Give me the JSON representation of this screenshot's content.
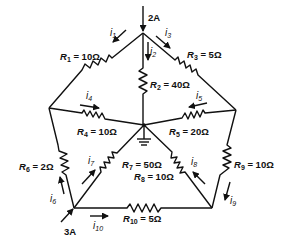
{
  "diagram": {
    "type": "circuit",
    "nodes": {
      "top": {
        "x": 143,
        "y": 33
      },
      "left": {
        "x": 49,
        "y": 108
      },
      "right": {
        "x": 236,
        "y": 110
      },
      "center": {
        "x": 144,
        "y": 125
      },
      "bottom_left": {
        "x": 74,
        "y": 208
      },
      "bottom_right": {
        "x": 212,
        "y": 208
      }
    },
    "sources": [
      {
        "id": "src_top",
        "label": "2A",
        "node": "top",
        "direction": "in"
      },
      {
        "id": "src_bl",
        "label": "3A",
        "node": "bottom_left",
        "direction": "in"
      }
    ],
    "resistors": [
      {
        "id": "R1",
        "name": "R",
        "sub": "1",
        "value": " = 10Ω",
        "from": "top",
        "to": "left"
      },
      {
        "id": "R2",
        "name": "R",
        "sub": "2",
        "value": " = 40Ω",
        "from": "top",
        "to": "center"
      },
      {
        "id": "R3",
        "name": "R",
        "sub": "3",
        "value": " = 5Ω",
        "from": "top",
        "to": "right"
      },
      {
        "id": "R4",
        "name": "R",
        "sub": "4",
        "value": " = 10Ω",
        "from": "left",
        "to": "center"
      },
      {
        "id": "R5",
        "name": "R",
        "sub": "5",
        "value": " = 20Ω",
        "from": "right",
        "to": "center"
      },
      {
        "id": "R6",
        "name": "R",
        "sub": "6",
        "value": " = 2Ω",
        "from": "bottom_left",
        "to": "left"
      },
      {
        "id": "R7",
        "name": "R",
        "sub": "7",
        "value": " = 50Ω",
        "from": "bottom_left",
        "to": "center"
      },
      {
        "id": "R8",
        "name": "R",
        "sub": "8",
        "value": " = 10Ω",
        "from": "bottom_right",
        "to": "center"
      },
      {
        "id": "R9",
        "name": "R",
        "sub": "9",
        "value": " = 10Ω",
        "from": "right",
        "to": "bottom_right"
      },
      {
        "id": "R10",
        "name": "R",
        "sub": "10",
        "value": " = 5Ω",
        "from": "bottom_left",
        "to": "bottom_right"
      }
    ],
    "currents": [
      {
        "id": "i1",
        "name": "i",
        "sub": "1"
      },
      {
        "id": "i2",
        "name": "i",
        "sub": "2"
      },
      {
        "id": "i3",
        "name": "i",
        "sub": "3"
      },
      {
        "id": "i4",
        "name": "i",
        "sub": "4"
      },
      {
        "id": "i5",
        "name": "i",
        "sub": "5"
      },
      {
        "id": "i6",
        "name": "i",
        "sub": "6"
      },
      {
        "id": "i7",
        "name": "i",
        "sub": "7"
      },
      {
        "id": "i8",
        "name": "i",
        "sub": "8"
      },
      {
        "id": "i9",
        "name": "i",
        "sub": "9"
      },
      {
        "id": "i10",
        "name": "i",
        "sub": "10"
      }
    ],
    "ground": {
      "node": "center",
      "icon": "ground-icon"
    }
  }
}
